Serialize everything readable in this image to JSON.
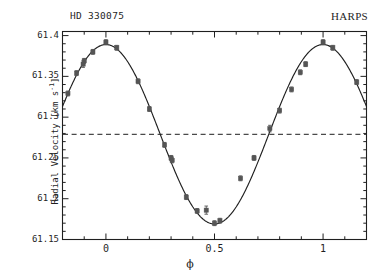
{
  "figure": {
    "title_left": "HD 330075",
    "title_right": "HARPS",
    "background": "#ffffff",
    "foreground": "#1f1f1f"
  },
  "axes": {
    "ylabel_text": "Radial Velocity [km s",
    "ylabel_exponent": "-1",
    "ylabel_close": "]",
    "xlabel": "ϕ",
    "ytick_labels": [
      "61.4",
      "61.35",
      "61.3",
      "61.25",
      "61.2",
      "61.15"
    ],
    "xtick_labels": [
      "0",
      "0.5",
      "1"
    ]
  },
  "chart_data": {
    "type": "scatter",
    "title": "HD 330075",
    "subtitle": "HARPS",
    "xlabel": "ϕ",
    "ylabel": "Radial Velocity [km s^-1]",
    "xlim": [
      -0.2,
      1.2
    ],
    "ylim": [
      61.15,
      61.405
    ],
    "grid": false,
    "legend": null,
    "xticks": [
      0,
      0.5,
      1
    ],
    "xtick_labels": [
      "0",
      "0.5",
      "1"
    ],
    "xminor_step": 0.1,
    "yticks": [
      61.15,
      61.2,
      61.25,
      61.3,
      61.35,
      61.4
    ],
    "ytick_labels": [
      "61.15",
      "61.2",
      "61.25",
      "61.3",
      "61.25",
      "61.4"
    ],
    "yminor_step": 0.01,
    "marker": "filled-square",
    "marker_color": "#555555",
    "errorbars": true,
    "series": [
      {
        "name": "HARPS radial velocity measurements",
        "type": "scatter",
        "points": [
          {
            "x": -0.175,
            "y": 61.329,
            "yerr": 0.003
          },
          {
            "x": -0.135,
            "y": 61.354,
            "yerr": 0.003
          },
          {
            "x": -0.105,
            "y": 61.365,
            "yerr": 0.004
          },
          {
            "x": -0.1,
            "y": 61.369,
            "yerr": 0.003
          },
          {
            "x": -0.06,
            "y": 61.38,
            "yerr": 0.003
          },
          {
            "x": 0.0,
            "y": 61.392,
            "yerr": 0.003
          },
          {
            "x": 0.05,
            "y": 61.385,
            "yerr": 0.003
          },
          {
            "x": 0.148,
            "y": 61.344,
            "yerr": 0.003
          },
          {
            "x": 0.2,
            "y": 61.31,
            "yerr": 0.003
          },
          {
            "x": 0.27,
            "y": 61.266,
            "yerr": 0.003
          },
          {
            "x": 0.3,
            "y": 61.25,
            "yerr": 0.003
          },
          {
            "x": 0.305,
            "y": 61.247,
            "yerr": 0.003
          },
          {
            "x": 0.37,
            "y": 61.202,
            "yerr": 0.003
          },
          {
            "x": 0.42,
            "y": 61.185,
            "yerr": 0.003
          },
          {
            "x": 0.462,
            "y": 61.186,
            "yerr": 0.005
          },
          {
            "x": 0.5,
            "y": 61.17,
            "yerr": 0.003
          },
          {
            "x": 0.525,
            "y": 61.173,
            "yerr": 0.003
          },
          {
            "x": 0.62,
            "y": 61.225,
            "yerr": 0.003
          },
          {
            "x": 0.682,
            "y": 61.25,
            "yerr": 0.003
          },
          {
            "x": 0.755,
            "y": 61.286,
            "yerr": 0.004
          },
          {
            "x": 0.8,
            "y": 61.308,
            "yerr": 0.003
          },
          {
            "x": 0.855,
            "y": 61.334,
            "yerr": 0.003
          },
          {
            "x": 0.895,
            "y": 61.355,
            "yerr": 0.003
          },
          {
            "x": 0.92,
            "y": 61.365,
            "yerr": 0.003
          },
          {
            "x": 1.0,
            "y": 61.392,
            "yerr": 0.003
          },
          {
            "x": 1.045,
            "y": 61.385,
            "yerr": 0.003
          },
          {
            "x": 1.155,
            "y": 61.343,
            "yerr": 0.003
          }
        ]
      },
      {
        "name": "Keplerian / sinusoidal fit",
        "type": "line",
        "model": "sinusoid",
        "amplitude_km_s": 0.11,
        "systemic_velocity_km_s": 61.279,
        "phase_of_maximum": 0.0,
        "period_phase": 1.0,
        "color": "#1f1f1f"
      },
      {
        "name": "Systemic velocity (dashed)",
        "type": "hline",
        "y": 61.279,
        "style": "dashed",
        "color": "#4a4a4a"
      }
    ]
  }
}
